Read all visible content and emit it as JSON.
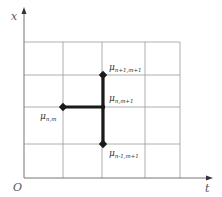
{
  "diagram": {
    "type": "finite-difference-stencil",
    "axes": {
      "x_label": "x",
      "t_label": "t",
      "origin_label": "O"
    },
    "grid": {
      "x_lines": [
        24,
        63,
        102,
        145,
        180
      ],
      "y_lines": [
        42,
        75,
        107,
        144,
        178
      ],
      "color": "#9a9a9a"
    },
    "nodes": [
      {
        "id": "top",
        "x": 103,
        "y": 75,
        "symbol": "μ",
        "subscript": "n+1,m+1",
        "label_x": 109,
        "label_y": 70
      },
      {
        "id": "center",
        "x": 103,
        "y": 107,
        "symbol": "μ",
        "subscript": "n,m+1",
        "label_x": 109,
        "label_y": 101
      },
      {
        "id": "left",
        "x": 63,
        "y": 107,
        "symbol": "μ",
        "subscript": "n,m",
        "label_x": 40,
        "label_y": 119
      },
      {
        "id": "bottom",
        "x": 103,
        "y": 144,
        "symbol": "μ",
        "subscript": "n-1,m+1",
        "label_x": 109,
        "label_y": 156
      }
    ],
    "edges": [
      [
        "left",
        "center"
      ],
      [
        "top",
        "center"
      ],
      [
        "center",
        "bottom"
      ]
    ],
    "stencil_color": "#1a1a1a"
  }
}
